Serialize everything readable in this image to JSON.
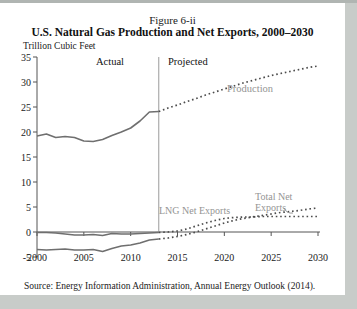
{
  "figure": {
    "caption": "Figure 6-ii",
    "title": "U.S. Natural Gas Production and Net Exports, 2000–2030",
    "units": "Trillion Cubic Feet",
    "source": "Source: Energy Information Administration, Annual Energy Outlook (2014)."
  },
  "chart_data": {
    "type": "line",
    "title": "U.S. Natural Gas Production and Net Exports, 2000–2030",
    "xlabel": "",
    "ylabel": "Trillion Cubic Feet",
    "xlim": [
      2000,
      2030
    ],
    "ylim": [
      -5,
      35
    ],
    "x_ticks": [
      2000,
      2005,
      2010,
      2015,
      2020,
      2025,
      2030
    ],
    "y_ticks": [
      -5,
      0,
      5,
      10,
      15,
      20,
      25,
      30,
      35
    ],
    "grid": false,
    "legend_position": "inline-annotations",
    "divider_x": 2013,
    "annotations": {
      "actual": "Actual",
      "projected": "Projected",
      "production": "Production",
      "lng": "LNG Net Exports",
      "total_line1": "Total Net",
      "total_line2": "Exports"
    },
    "colors": {
      "solid_line": "#6f6f6f",
      "dotted_line": "#4c4c4c",
      "axis": "#555555",
      "divider": "#9a9a9a",
      "gray_label": "#949494"
    },
    "series": [
      {
        "name": "Production (actual)",
        "style": "solid",
        "x_start": 2000,
        "values": [
          19.2,
          19.6,
          18.9,
          19.1,
          18.9,
          18.2,
          18.1,
          18.5,
          19.3,
          20.0,
          20.8,
          22.2,
          24.0,
          24.1
        ]
      },
      {
        "name": "Production (projected)",
        "style": "dotted",
        "x_start": 2013,
        "values": [
          24.1,
          24.8,
          25.4,
          26.1,
          26.7,
          27.4,
          28.0,
          28.6,
          29.2,
          29.8,
          30.3,
          30.8,
          31.3,
          31.7,
          32.1,
          32.5,
          32.9,
          33.2
        ]
      },
      {
        "name": "Total Net Exports (actual)",
        "style": "solid",
        "x_start": 2000,
        "values": [
          -3.5,
          -3.6,
          -3.5,
          -3.4,
          -3.6,
          -3.6,
          -3.5,
          -3.9,
          -3.3,
          -2.8,
          -2.6,
          -2.2,
          -1.6,
          -1.4
        ]
      },
      {
        "name": "Total Net Exports (projected)",
        "style": "dotted",
        "x_start": 2013,
        "values": [
          -1.4,
          -1.2,
          -0.9,
          -0.5,
          0.0,
          0.6,
          1.2,
          1.8,
          2.3,
          2.7,
          3.0,
          3.3,
          3.6,
          3.9,
          4.1,
          4.3,
          4.6,
          4.8
        ]
      },
      {
        "name": "LNG Net Exports (actual)",
        "style": "solid",
        "x_start": 2000,
        "values": [
          -0.1,
          -0.1,
          -0.2,
          -0.4,
          -0.6,
          -0.6,
          -0.5,
          -0.7,
          -0.3,
          -0.4,
          -0.4,
          -0.3,
          -0.2,
          -0.1
        ]
      },
      {
        "name": "LNG Net Exports (projected)",
        "style": "dotted",
        "x_start": 2013,
        "values": [
          -0.1,
          0.0,
          0.2,
          0.6,
          1.2,
          1.8,
          2.3,
          2.7,
          2.9,
          3.0,
          3.0,
          3.1,
          3.1,
          3.1,
          3.1,
          3.1,
          3.1,
          3.1
        ]
      }
    ]
  }
}
